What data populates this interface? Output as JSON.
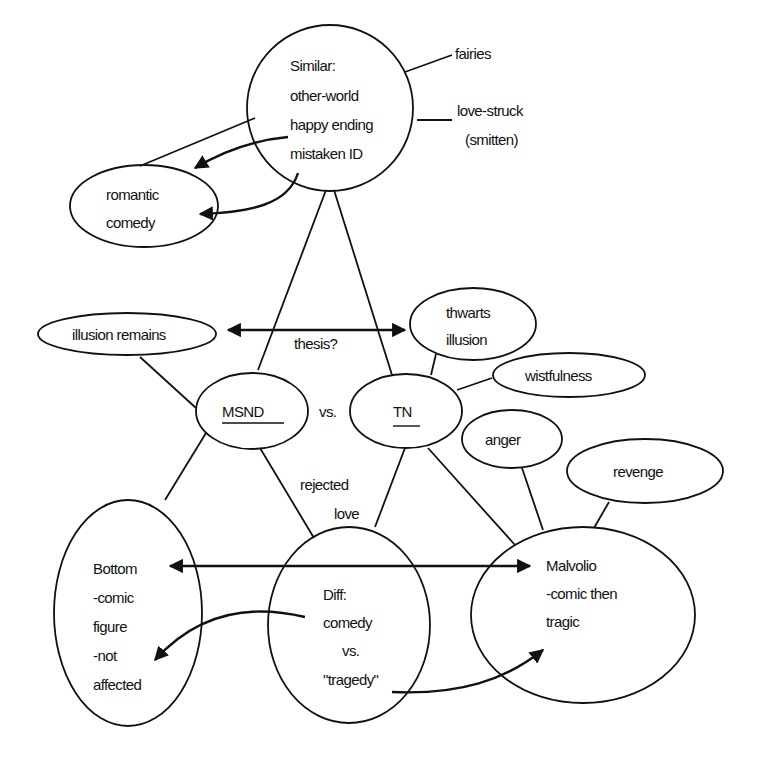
{
  "diagram": {
    "type": "concept-map",
    "nodes": {
      "similar": {
        "lines": [
          "Similar:",
          "other-world",
          "happy ending",
          "mistaken ID"
        ]
      },
      "fairies": {
        "label": "fairies"
      },
      "lovestruck": {
        "lines": [
          "love-struck",
          "(smitten)"
        ]
      },
      "romantic": {
        "lines": [
          "romantic",
          "comedy"
        ]
      },
      "illusion_remains": {
        "label": "illusion remains"
      },
      "thesis": {
        "label": "thesis?"
      },
      "thwarts": {
        "lines": [
          "thwarts",
          "illusion"
        ]
      },
      "wistfulness": {
        "label": "wistfulness"
      },
      "msnd": {
        "label": "MSND"
      },
      "vs": {
        "label": "vs."
      },
      "tn": {
        "label": "TN"
      },
      "anger": {
        "label": "anger"
      },
      "revenge": {
        "label": "revenge"
      },
      "rejected_love": {
        "lines": [
          "rejected",
          "love"
        ]
      },
      "bottom": {
        "lines": [
          "Bottom",
          "-comic",
          "figure",
          "-not",
          "affected"
        ]
      },
      "diff": {
        "lines": [
          "Diff:",
          "comedy",
          "vs.",
          "\"tragedy\""
        ]
      },
      "malvolio": {
        "lines": [
          "Malvolio",
          "-comic then",
          "tragic"
        ]
      }
    },
    "edges": [
      {
        "from": "similar",
        "to": "fairies"
      },
      {
        "from": "similar",
        "to": "lovestruck"
      },
      {
        "from": "similar",
        "to": "romantic",
        "arrow": true
      },
      {
        "from": "similar",
        "to": "msnd"
      },
      {
        "from": "similar",
        "to": "tn"
      },
      {
        "from": "thesis",
        "to": "illusion_remains",
        "arrow": true
      },
      {
        "from": "thesis",
        "to": "thwarts",
        "arrow": true
      },
      {
        "from": "msnd",
        "to": "illusion_remains"
      },
      {
        "from": "tn",
        "to": "thwarts"
      },
      {
        "from": "tn",
        "to": "wistfulness"
      },
      {
        "from": "msnd",
        "to": "bottom"
      },
      {
        "from": "msnd",
        "to": "diff"
      },
      {
        "from": "tn",
        "to": "diff"
      },
      {
        "from": "tn",
        "to": "malvolio"
      },
      {
        "from": "anger",
        "to": "malvolio"
      },
      {
        "from": "revenge",
        "to": "malvolio"
      },
      {
        "from": "diff",
        "to": "bottom",
        "arrow": true
      },
      {
        "from": "diff",
        "to": "malvolio",
        "arrow": true
      },
      {
        "from": "bottom",
        "to": "malvolio",
        "arrow": "both"
      }
    ],
    "colors": {
      "ink": "#111111",
      "background": "#ffffff"
    }
  }
}
